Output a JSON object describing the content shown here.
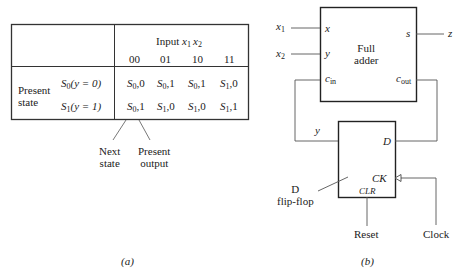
{
  "figure_a": {
    "caption": "(a)",
    "input_header": {
      "label": "Input ",
      "var1": "x",
      "sub1": "1",
      "var2": "x",
      "sub2": "2"
    },
    "columns": [
      "00",
      "01",
      "10",
      "11"
    ],
    "row_header": {
      "line1": "Present",
      "line2": "state"
    },
    "rows": [
      {
        "state": "S",
        "state_sub": "0",
        "cond": "(y = 0)",
        "cells": [
          {
            "s": "S",
            "sub": "0",
            "out": ",0"
          },
          {
            "s": "S",
            "sub": "0",
            "out": ",1"
          },
          {
            "s": "S",
            "sub": "0",
            "out": ",1"
          },
          {
            "s": "S",
            "sub": "1",
            "out": ",0"
          }
        ]
      },
      {
        "state": "S",
        "state_sub": "1",
        "cond": "(y = 1)",
        "cells": [
          {
            "s": "S",
            "sub": "0",
            "out": ",1"
          },
          {
            "s": "S",
            "sub": "1",
            "out": ",0"
          },
          {
            "s": "S",
            "sub": "1",
            "out": ",0"
          },
          {
            "s": "S",
            "sub": "1",
            "out": ",1"
          }
        ]
      }
    ],
    "annotations": {
      "next_state": {
        "line1": "Next",
        "line2": "state"
      },
      "present_output": {
        "line1": "Present",
        "line2": "output"
      }
    }
  },
  "figure_b": {
    "caption": "(b)",
    "full_adder": {
      "title_line1": "Full",
      "title_line2": "adder",
      "port_x": "x",
      "port_y": "y",
      "port_cin": "c",
      "port_cin_sub": "in",
      "port_s": "s",
      "port_cout": "c",
      "port_cout_sub": "out"
    },
    "inputs": {
      "x1": {
        "var": "x",
        "sub": "1"
      },
      "x2": {
        "var": "x",
        "sub": "2"
      }
    },
    "output_z": "z",
    "feedback_label": "y",
    "flip_flop": {
      "label_line1": "D",
      "label_line2": "flip-flop",
      "port_d": "D",
      "port_ck": "CK",
      "port_clr": "CLR"
    },
    "reset_label": "Reset",
    "clock_label": "Clock"
  }
}
